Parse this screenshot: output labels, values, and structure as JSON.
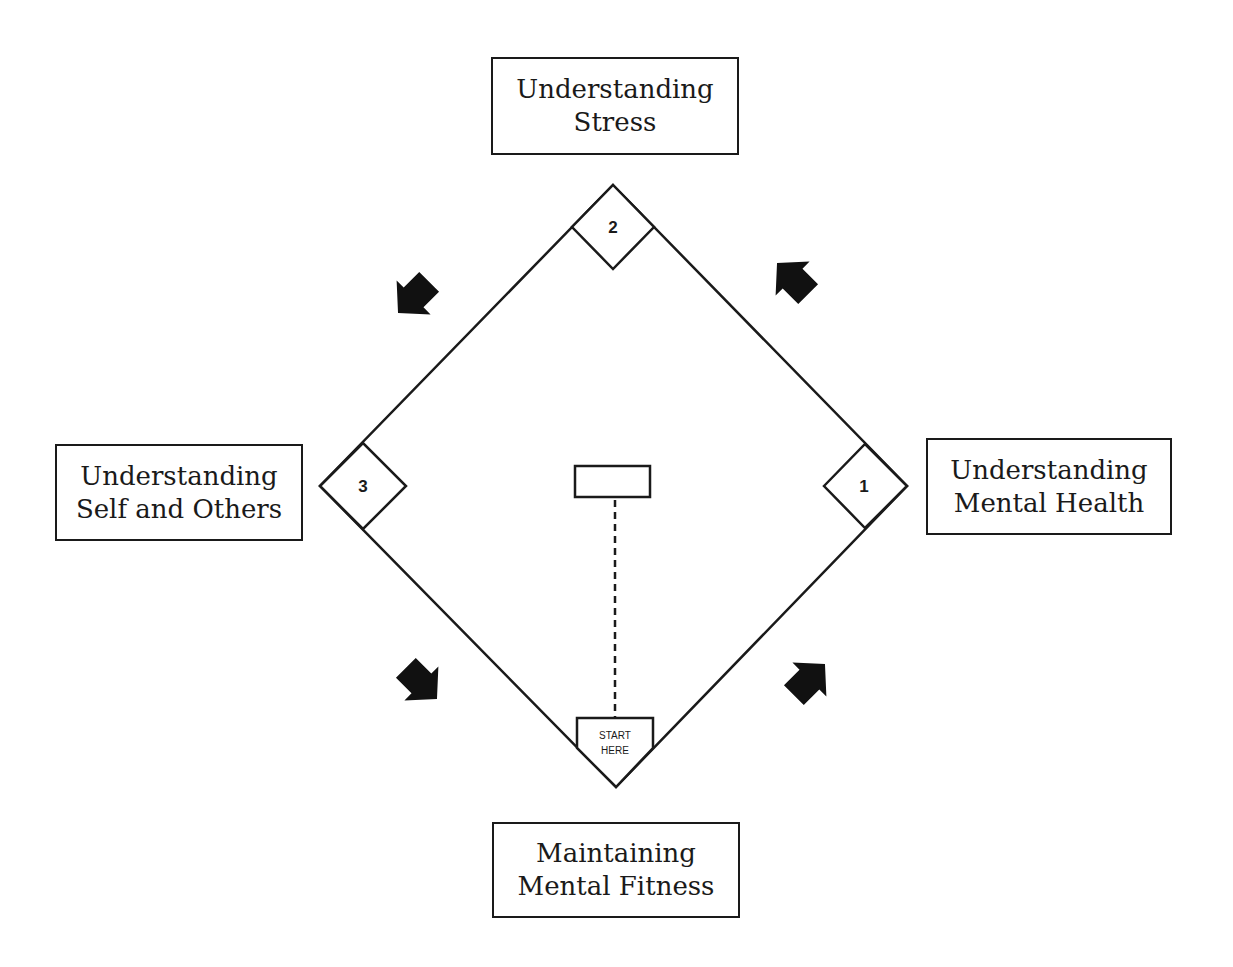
{
  "diagram": {
    "title_boxes": {
      "top": {
        "line1": "Understanding",
        "line2": "Stress"
      },
      "left": {
        "line1": "Understanding",
        "line2": "Self and Others"
      },
      "right": {
        "line1": "Understanding",
        "line2": "Mental Health"
      },
      "bottom": {
        "line1": "Maintaining",
        "line2": "Mental Fitness"
      }
    },
    "bases": {
      "first": "1",
      "second": "2",
      "third": "3"
    },
    "home_plate": {
      "line1": "START",
      "line2": "HERE"
    },
    "arrows": [
      {
        "position": "bottom-right",
        "direction": "up-right"
      },
      {
        "position": "top-right",
        "direction": "up-left"
      },
      {
        "position": "top-left",
        "direction": "down-left"
      },
      {
        "position": "bottom-left",
        "direction": "down-right"
      }
    ]
  }
}
